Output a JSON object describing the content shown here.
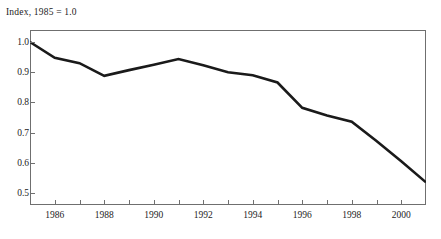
{
  "chart_data": {
    "type": "line",
    "title": "Index, 1985 = 1.0",
    "xlabel": "",
    "ylabel": "",
    "xlim": [
      1985,
      2001
    ],
    "ylim": [
      0.46,
      1.04
    ],
    "grid": false,
    "legend": "none",
    "x": [
      1985,
      1986,
      1987,
      1988,
      1989,
      1990,
      1991,
      1992,
      1993,
      1994,
      1995,
      1996,
      1997,
      1998,
      1999,
      2000,
      2001
    ],
    "values": [
      1.0,
      0.948,
      0.93,
      0.888,
      0.907,
      0.925,
      0.944,
      0.923,
      0.9,
      0.89,
      0.866,
      0.782,
      0.757,
      0.736,
      0.672,
      0.605,
      0.535
    ],
    "series": [
      {
        "name": "Index",
        "color": "#1a1a1a",
        "values": [
          1.0,
          0.948,
          0.93,
          0.888,
          0.907,
          0.925,
          0.944,
          0.923,
          0.9,
          0.89,
          0.866,
          0.782,
          0.757,
          0.736,
          0.672,
          0.605,
          0.535
        ]
      }
    ],
    "ytick_labels": [
      "1.0",
      "0.9",
      "0.8",
      "0.7",
      "0.6",
      "0.5"
    ],
    "ytick_values": [
      1.0,
      0.9,
      0.8,
      0.7,
      0.6,
      0.5
    ],
    "xtick_labels": [
      "1986",
      "1988",
      "1990",
      "1992",
      "1994",
      "1996",
      "1998",
      "2000"
    ],
    "xtick_values": [
      1986,
      1988,
      1990,
      1992,
      1994,
      1996,
      1998,
      2000
    ],
    "xminor_tick_values": [
      1985,
      1986,
      1987,
      1988,
      1989,
      1990,
      1991,
      1992,
      1993,
      1994,
      1995,
      1996,
      1997,
      1998,
      1999,
      2000,
      2001
    ],
    "line_color": "#1a1a1a",
    "line_width": 2.6,
    "axis_color": "#6f6f6f",
    "background": "#ffffff"
  }
}
